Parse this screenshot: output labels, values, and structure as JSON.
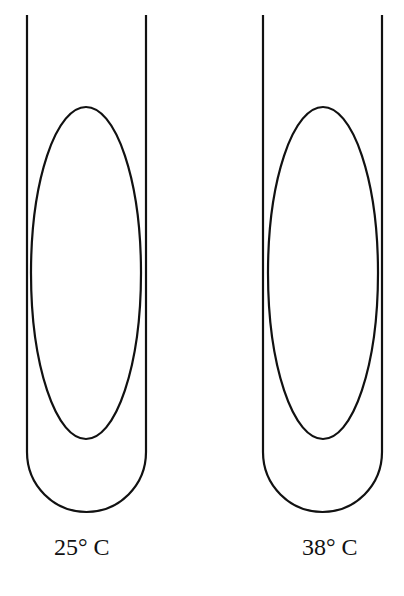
{
  "diagram": {
    "tubes": [
      {
        "label": "25° C"
      },
      {
        "label": "38° C"
      }
    ],
    "stroke_color": "#111111",
    "background": "#ffffff"
  }
}
